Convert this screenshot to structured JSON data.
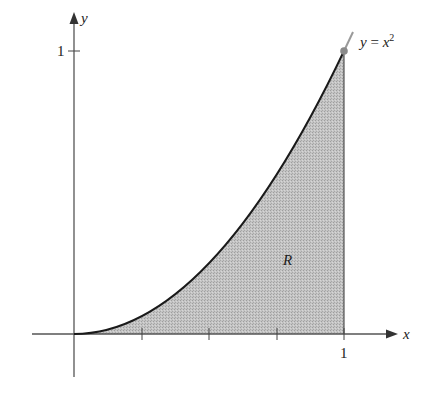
{
  "figure": {
    "curve_label": "y = x²",
    "curve_label_parts": {
      "lhs": "y",
      "eq": " = ",
      "rhs": "x",
      "exp": "2"
    },
    "region_label": "R",
    "axes": {
      "x_label": "x",
      "y_label": "y",
      "x_tick_label": "1",
      "y_tick_label": "1",
      "x_minor_ticks": [
        0.25,
        0.5,
        0.75
      ]
    },
    "function": "x^2",
    "shaded_region": {
      "x_from": 0,
      "x_to": 1,
      "between": [
        "y = x^2",
        "y = 0"
      ]
    },
    "colors": {
      "fill": "#b8b8b8",
      "curve": "#1a1a1a",
      "axis": "#555555",
      "endpoint_dot": "#8a8a8a",
      "extension": "#9a9a9a"
    }
  }
}
